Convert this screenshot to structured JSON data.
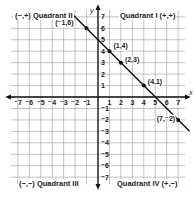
{
  "chart_data": {
    "type": "line",
    "title": "",
    "xlabel": "x",
    "ylabel": "y",
    "xlim": [
      -7,
      7
    ],
    "ylim": [
      -7,
      7
    ],
    "grid": true,
    "x_ticks": [
      -7,
      -6,
      -5,
      -4,
      -3,
      -2,
      -1,
      1,
      2,
      3,
      4,
      5,
      6,
      7
    ],
    "y_ticks": [
      -7,
      -6,
      -5,
      -4,
      -3,
      -2,
      -1,
      1,
      2,
      3,
      4,
      5,
      6,
      7
    ],
    "series": [
      {
        "name": "y = -x + 5",
        "points": [
          {
            "x": -1,
            "y": 6,
            "label": "(-1,6)"
          },
          {
            "x": 1,
            "y": 4,
            "label": "(1,4)"
          },
          {
            "x": 2,
            "y": 3,
            "label": "(2,3)"
          },
          {
            "x": 4,
            "y": 1,
            "label": "(4,1)"
          },
          {
            "x": 7,
            "y": -2,
            "label": "(7,-2)"
          }
        ],
        "line_extent": {
          "x_start": -2.3,
          "x_end": 8.0
        }
      }
    ],
    "annotations": [
      {
        "text": "(−,+) Quadrant II",
        "quadrant": "II"
      },
      {
        "text": "Quadrant I (+,+)",
        "quadrant": "I"
      },
      {
        "text": "(−,−) Quadrant III",
        "quadrant": "III"
      },
      {
        "text": "Quadrant IV (+,−)",
        "quadrant": "IV"
      }
    ]
  },
  "quadrants": {
    "q2": "(−,+) Quadrant II",
    "q1": "Quadrant I  (+,+)",
    "q3": "(−,−) Quadrant III",
    "q4": "Quadrant IV  (+,−)"
  },
  "axes": {
    "x_label": "x",
    "y_label": "y"
  },
  "colors": {
    "grid": "#9a9a9a",
    "axis": "#111111",
    "line": "#111111",
    "text": "#222222"
  }
}
